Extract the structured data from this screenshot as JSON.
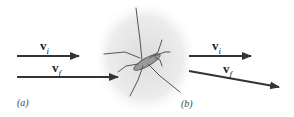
{
  "panels": [
    {
      "caption": "(a)",
      "vectors": [
        {
          "symbol": "v",
          "subscript": "i",
          "x1": 17,
          "y1": 56,
          "x2": 79,
          "y2": 56
        },
        {
          "symbol": "v",
          "subscript": "f",
          "x1": 17,
          "y1": 77,
          "x2": 118,
          "y2": 77
        }
      ]
    },
    {
      "caption": "(b)",
      "vectors": [
        {
          "symbol": "v",
          "subscript": "i",
          "x1": 189,
          "y1": 56,
          "x2": 251,
          "y2": 56
        },
        {
          "symbol": "v",
          "subscript": "f",
          "x1": 189,
          "y1": 71,
          "x2": 279,
          "y2": 87
        }
      ]
    }
  ],
  "illustration": {
    "subject": "water-strider-insect"
  },
  "colors": {
    "arrow": "#333333",
    "shadow": "#e6e6e6"
  }
}
